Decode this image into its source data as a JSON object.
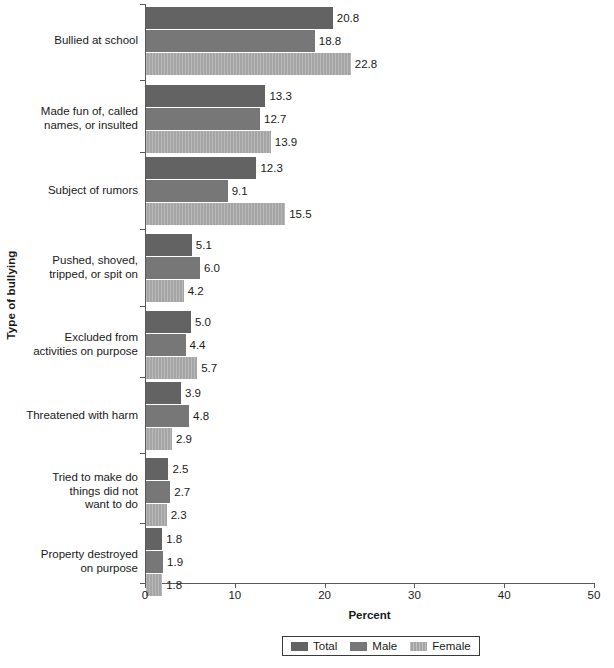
{
  "chart_data": {
    "type": "bar",
    "orientation": "horizontal",
    "title": "",
    "xlabel": "Percent",
    "ylabel": "Type of bullying",
    "xlim": [
      0,
      50
    ],
    "xticks": [
      0,
      10,
      20,
      30,
      40,
      50
    ],
    "grid": false,
    "legend_position": "bottom",
    "categories": [
      "Bullied at school",
      "Made fun of, called names, or insulted",
      "Subject of rumors",
      "Pushed, shoved, tripped, or spit on",
      "Excluded from activities on purpose",
      "Threatened with harm",
      "Tried to make do things did not want to do",
      "Property destroyed on purpose"
    ],
    "category_lines": [
      [
        "Bullied at school"
      ],
      [
        "Made fun of, called",
        "names, or insulted"
      ],
      [
        "Subject of rumors"
      ],
      [
        "Pushed, shoved,",
        "tripped, or spit on"
      ],
      [
        "Excluded from",
        "activities on purpose"
      ],
      [
        "Threatened with harm"
      ],
      [
        "Tried to make do",
        "things did not",
        "want to do"
      ],
      [
        "Property destroyed",
        "on purpose"
      ]
    ],
    "series": [
      {
        "name": "Total",
        "color": "#636363",
        "values": [
          20.8,
          13.3,
          12.3,
          5.1,
          5.0,
          3.9,
          2.5,
          1.8
        ]
      },
      {
        "name": "Male",
        "color": "#777777",
        "values": [
          18.8,
          12.7,
          9.1,
          6.0,
          4.4,
          4.8,
          2.7,
          1.9
        ]
      },
      {
        "name": "Female",
        "color": "#a5a5a5",
        "values": [
          22.8,
          13.9,
          15.5,
          4.2,
          5.7,
          2.9,
          2.3,
          1.8
        ]
      }
    ],
    "value_labels": [
      [
        "20.8",
        "18.8",
        "22.8"
      ],
      [
        "13.3",
        "12.7",
        "13.9"
      ],
      [
        "12.3",
        "9.1",
        "15.5"
      ],
      [
        "5.1",
        "6.0",
        "4.2"
      ],
      [
        "5.0",
        "4.4",
        "5.7"
      ],
      [
        "3.9",
        "4.8",
        "2.9"
      ],
      [
        "2.5",
        "2.7",
        "2.3"
      ],
      [
        "1.8",
        "1.9",
        "1.8"
      ]
    ]
  },
  "axis": {
    "x_title": "Percent",
    "y_title": "Type of bullying",
    "x_tick_labels": [
      "0",
      "10",
      "20",
      "30",
      "40",
      "50"
    ]
  },
  "legend": {
    "items": [
      {
        "label": "Total",
        "key": "total"
      },
      {
        "label": "Male",
        "key": "male"
      },
      {
        "label": "Female",
        "key": "female"
      }
    ]
  }
}
